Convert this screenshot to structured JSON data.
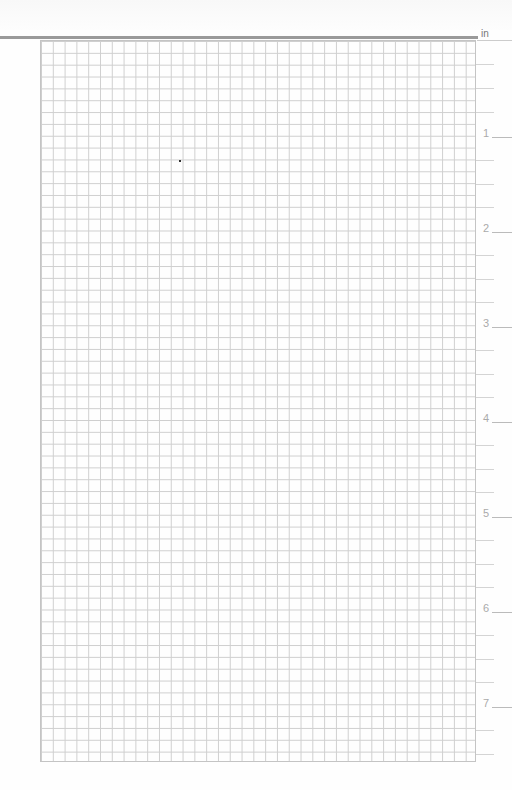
{
  "page": {
    "type": "graph-paper",
    "unit_label": "in",
    "grid_color": "#cfcfcf",
    "rule_color": "#9a9a9a"
  },
  "ruler": {
    "labels": [
      "1",
      "2",
      "3",
      "4",
      "5",
      "6",
      "7"
    ]
  }
}
